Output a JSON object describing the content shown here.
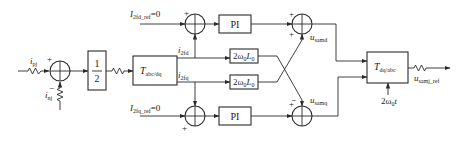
{
  "diagram": {
    "inputs": {
      "i_pj": {
        "main": "i",
        "sub": "pj"
      },
      "i_nj": {
        "main": "i",
        "sub": "nj"
      },
      "I_2fd_ref": {
        "main": "I",
        "sub": "2fd_ref",
        "value": "=0"
      },
      "I_2fq_ref": {
        "main": "I",
        "sub": "2fq_ref",
        "value": "=0"
      },
      "theta": {
        "text": "2ω",
        "sub": "0",
        "tail": "t"
      }
    },
    "blocks": {
      "half": {
        "numerator": "1",
        "denominator": "2"
      },
      "abc_to_dq": {
        "main": "T",
        "sub": "abc/dq"
      },
      "pi_d": {
        "label": "PI"
      },
      "pi_q": {
        "label": "PI"
      },
      "cross_d": {
        "text": "2ω",
        "sub0": "0",
        "L": "L",
        "sub1": "0"
      },
      "cross_q": {
        "text": "2ω",
        "sub0": "0",
        "L": "L",
        "sub1": "0"
      },
      "dq_to_abc": {
        "main": "T",
        "sub": "dq/abc"
      }
    },
    "signals": {
      "i_2fd": {
        "main": "i",
        "sub": "2fd"
      },
      "i_2fq": {
        "main": "i",
        "sub": "2fq"
      },
      "u_samd": {
        "main": "u",
        "sub": "samd"
      },
      "u_samq": {
        "main": "u",
        "sub": "samq"
      },
      "output": {
        "main": "u",
        "sub": "samj_ref"
      }
    },
    "signs": {
      "left_sum_top": "+",
      "left_sum_bottom": "−",
      "top_sum_left": "+",
      "bottom_sum_left": "+",
      "right_top_sum_left": "+",
      "right_top_sum_top": "+",
      "right_top_sum_bottom": "+",
      "right_bottom_sum_left": "+",
      "right_bottom_sum_top": "−"
    },
    "colors": {
      "line": "#2a2a2a",
      "background": "#ffffff"
    }
  }
}
